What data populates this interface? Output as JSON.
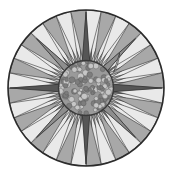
{
  "figure": {
    "type": "radial-rosette",
    "canvas": {
      "width": 172,
      "height": 177,
      "background": "#ffffff"
    },
    "center": {
      "cx": 86,
      "cy": 88
    },
    "outer_circle": {
      "radius": 78,
      "stroke": "#2b2b2b",
      "stroke_width": 1.6,
      "fill": "#e9e9e9"
    },
    "inner_circle": {
      "radius": 28,
      "stroke": "#3a3a3a",
      "stroke_width": 1.4,
      "fill": "#9a9a9a"
    },
    "palette": {
      "background": "#ffffff",
      "rim_stroke": "#2b2b2b",
      "field_light": "#e9e9e9",
      "wedge_light": "#d9d9d9",
      "wedge_mid": "#a8a8a8",
      "wedge_dark": "#6e6e6e",
      "star_dark": "#565656",
      "star_mid": "#8e8e8e",
      "hub_fill": "#9a9a9a",
      "hub_pebble_light": "#c6c6c6",
      "hub_pebble_dark": "#7d7d7d",
      "outline": "#333333"
    },
    "ray_count": 32,
    "star_points_major": 4,
    "star_points_minor": 4,
    "hub_pebble_count": 44,
    "labels": {
      "alt_text": "Circular rosette with radiating triangular spokes and a textured central disc",
      "caption": ""
    }
  },
  "chart_data": {
    "type": "pie",
    "xlabel": "",
    "ylabel": "",
    "categories": [
      "ray-00",
      "ray-01",
      "ray-02",
      "ray-03",
      "ray-04",
      "ray-05",
      "ray-06",
      "ray-07",
      "ray-08",
      "ray-09",
      "ray-10",
      "ray-11",
      "ray-12",
      "ray-13",
      "ray-14",
      "ray-15",
      "ray-16",
      "ray-17",
      "ray-18",
      "ray-19",
      "ray-20",
      "ray-21",
      "ray-22",
      "ray-23",
      "ray-24",
      "ray-25",
      "ray-26",
      "ray-27",
      "ray-28",
      "ray-29",
      "ray-30",
      "ray-31"
    ],
    "values": [
      1,
      1,
      1,
      1,
      1,
      1,
      1,
      1,
      1,
      1,
      1,
      1,
      1,
      1,
      1,
      1,
      1,
      1,
      1,
      1,
      1,
      1,
      1,
      1,
      1,
      1,
      1,
      1,
      1,
      1,
      1,
      1
    ],
    "ray_shades": [
      "#6e6e6e",
      "#d9d9d9",
      "#a8a8a8",
      "#d9d9d9",
      "#6e6e6e",
      "#d9d9d9",
      "#a8a8a8",
      "#d9d9d9",
      "#6e6e6e",
      "#d9d9d9",
      "#a8a8a8",
      "#d9d9d9",
      "#6e6e6e",
      "#d9d9d9",
      "#a8a8a8",
      "#d9d9d9",
      "#6e6e6e",
      "#d9d9d9",
      "#a8a8a8",
      "#d9d9d9",
      "#6e6e6e",
      "#d9d9d9",
      "#a8a8a8",
      "#d9d9d9",
      "#6e6e6e",
      "#d9d9d9",
      "#a8a8a8",
      "#d9d9d9",
      "#6e6e6e",
      "#d9d9d9",
      "#a8a8a8",
      "#d9d9d9"
    ],
    "star_major": [
      {
        "name": "north-point",
        "angle_deg": 270,
        "length": 76,
        "half_width_deg": 11,
        "fill": "#565656"
      },
      {
        "name": "east-point",
        "angle_deg": 0,
        "length": 76,
        "half_width_deg": 11,
        "fill": "#565656"
      },
      {
        "name": "south-point",
        "angle_deg": 90,
        "length": 76,
        "half_width_deg": 11,
        "fill": "#565656"
      },
      {
        "name": "west-point",
        "angle_deg": 180,
        "length": 76,
        "half_width_deg": 11,
        "fill": "#565656"
      }
    ],
    "star_minor": [
      {
        "name": "northeast-point",
        "angle_deg": 315,
        "length": 70,
        "half_width_deg": 9,
        "fill": "#8e8e8e"
      },
      {
        "name": "southeast-point",
        "angle_deg": 45,
        "length": 70,
        "half_width_deg": 9,
        "fill": "#8e8e8e"
      },
      {
        "name": "southwest-point",
        "angle_deg": 135,
        "length": 70,
        "half_width_deg": 9,
        "fill": "#8e8e8e"
      },
      {
        "name": "northwest-point",
        "angle_deg": 225,
        "length": 70,
        "half_width_deg": 9,
        "fill": "#8e8e8e"
      }
    ],
    "legend": [],
    "grid": false,
    "legend_position": "none",
    "annotations": [
      {
        "name": "highlight-sliver",
        "angle_deg": 330,
        "note": "light curved sliver upper-right"
      }
    ]
  }
}
